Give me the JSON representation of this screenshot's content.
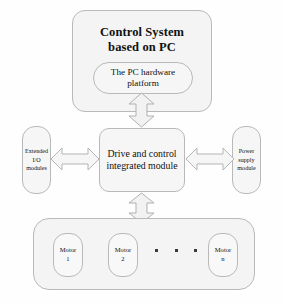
{
  "diagram": {
    "colors": {
      "block_fill": "#f6f6f6",
      "block_stroke": "#b9b9b9",
      "arrow_fill": "#f2f2f2",
      "arrow_stroke": "#b0b0b0",
      "text": "#111111",
      "background": "#fefefe"
    },
    "top_container": {
      "label": "Control System based on PC",
      "line1": "Control System",
      "line2": "based on PC"
    },
    "pc_platform": {
      "label": "The PC hardware platform",
      "line1": "The PC hardware",
      "line2": "platform"
    },
    "center_block": {
      "label": "Drive and control integrated module",
      "line1": "Drive and control",
      "line2": "integrated module"
    },
    "left_module": {
      "label": "Extended I/O modules",
      "line1": "Extended",
      "line2": "I/O",
      "line3": "modules"
    },
    "right_module": {
      "label": "Power supply module",
      "line1": "Power",
      "line2": "supply",
      "line3": "module"
    },
    "motors": {
      "container_label": "Motor group",
      "items": [
        {
          "line1": "Motor",
          "line2": "1",
          "label": "Motor 1"
        },
        {
          "line1": "Motor",
          "line2": "2",
          "label": "Motor 2"
        },
        {
          "line1": "Motor",
          "line2": "n",
          "label": "Motor n"
        }
      ],
      "ellipsis": "..."
    },
    "connectors": [
      {
        "name": "top-vertical",
        "from": "The PC hardware platform",
        "to": "Drive and control integrated module",
        "style": "double-headed-vertical"
      },
      {
        "name": "bottom-vertical",
        "from": "Drive and control integrated module",
        "to": "Motor group",
        "style": "double-headed-vertical"
      },
      {
        "name": "left-horizontal",
        "from": "Extended I/O modules",
        "to": "Drive and control integrated module",
        "style": "double-headed-horizontal"
      },
      {
        "name": "right-horizontal",
        "from": "Drive and control integrated module",
        "to": "Power supply module",
        "style": "double-headed-horizontal"
      }
    ]
  }
}
